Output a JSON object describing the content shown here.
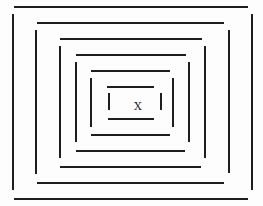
{
  "diagram": {
    "line_color": "#1e1e1e",
    "background_color": "#fdfdfd",
    "center_label": "X",
    "rectangles": [
      {
        "id": 1,
        "top": {
          "y": 6,
          "x1": 14,
          "x2": 248
        },
        "bottom": {
          "y": 198,
          "x1": 14,
          "x2": 248
        },
        "left": {
          "x": 12,
          "y1": 14,
          "y2": 190
        },
        "right": {
          "x": 251,
          "y1": 14,
          "y2": 190
        }
      },
      {
        "id": 2,
        "top": {
          "y": 22,
          "x1": 37,
          "x2": 224
        },
        "bottom": {
          "y": 182,
          "x1": 37,
          "x2": 224
        },
        "left": {
          "x": 35,
          "y1": 30,
          "y2": 174
        },
        "right": {
          "x": 228,
          "y1": 30,
          "y2": 173
        }
      },
      {
        "id": 3,
        "top": {
          "y": 38,
          "x1": 60,
          "x2": 202
        },
        "bottom": {
          "y": 166,
          "x1": 60,
          "x2": 201
        },
        "left": {
          "x": 59,
          "y1": 46,
          "y2": 158
        },
        "right": {
          "x": 204,
          "y1": 46,
          "y2": 158
        }
      },
      {
        "id": 4,
        "top": {
          "y": 54,
          "x1": 76,
          "x2": 186
        },
        "bottom": {
          "y": 150,
          "x1": 76,
          "x2": 185
        },
        "left": {
          "x": 75,
          "y1": 62,
          "y2": 142
        },
        "right": {
          "x": 188,
          "y1": 62,
          "y2": 142
        }
      },
      {
        "id": 5,
        "top": {
          "y": 70,
          "x1": 91,
          "x2": 170
        },
        "bottom": {
          "y": 134,
          "x1": 91,
          "x2": 170
        },
        "left": {
          "x": 90,
          "y1": 78,
          "y2": 127
        },
        "right": {
          "x": 172,
          "y1": 78,
          "y2": 127
        }
      },
      {
        "id": 6,
        "top": {
          "y": 86,
          "x1": 107,
          "x2": 154
        },
        "bottom": {
          "y": 118,
          "x1": 108,
          "x2": 154
        },
        "left": {
          "x": 108,
          "y1": 93,
          "y2": 110
        },
        "right": {
          "x": 160,
          "y1": 93,
          "y2": 110
        }
      }
    ],
    "center_mark_position": {
      "x": 133,
      "y": 101,
      "w": 10,
      "h": 12
    }
  }
}
